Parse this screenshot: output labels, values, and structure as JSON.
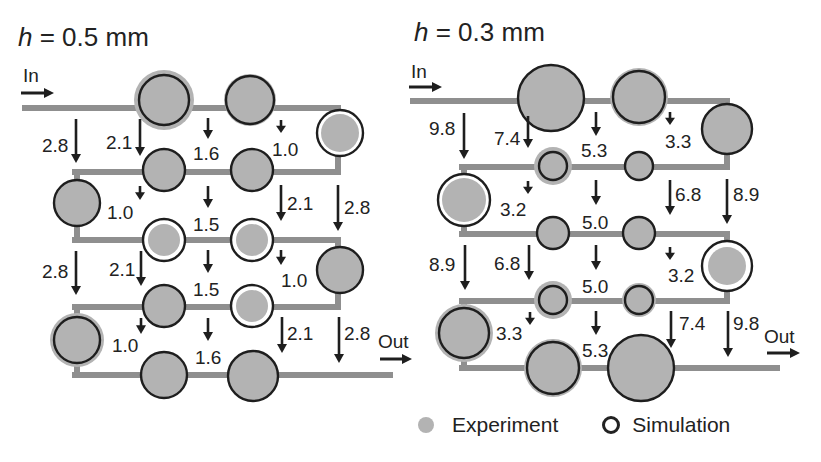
{
  "colors": {
    "channel": "#8f8f8f",
    "experiment_fill": "#b3b3b3",
    "simulation_stroke": "#1e1e1e",
    "arrow": "#1e1e1e",
    "text": "#222222"
  },
  "panels": [
    {
      "id": "h05",
      "title_var": "h",
      "title_rest": " = 0.5 mm",
      "in_label": "In",
      "out_label": "Out",
      "channels": [
        {
          "x1": 25,
          "y1": 108,
          "x2": 338,
          "y2": 108
        },
        {
          "x1": 338,
          "y1": 108,
          "x2": 338,
          "y2": 172
        },
        {
          "x1": 75,
          "y1": 172,
          "x2": 338,
          "y2": 172
        },
        {
          "x1": 77,
          "y1": 172,
          "x2": 77,
          "y2": 240
        },
        {
          "x1": 75,
          "y1": 240,
          "x2": 338,
          "y2": 240
        },
        {
          "x1": 338,
          "y1": 240,
          "x2": 338,
          "y2": 307
        },
        {
          "x1": 75,
          "y1": 307,
          "x2": 338,
          "y2": 307
        },
        {
          "x1": 77,
          "y1": 307,
          "x2": 77,
          "y2": 375
        },
        {
          "x1": 75,
          "y1": 375,
          "x2": 390,
          "y2": 375
        }
      ],
      "nodes": [
        {
          "cx": 164,
          "cy": 100,
          "exp_r": 30,
          "sim_r": 25
        },
        {
          "cx": 250,
          "cy": 100,
          "exp_r": 26,
          "sim_r": 24
        },
        {
          "cx": 340,
          "cy": 133,
          "exp_r": 19,
          "sim_r": 23
        },
        {
          "cx": 164,
          "cy": 170,
          "exp_r": 21,
          "sim_r": 21
        },
        {
          "cx": 252,
          "cy": 170,
          "exp_r": 21,
          "sim_r": 21
        },
        {
          "cx": 77,
          "cy": 203,
          "exp_r": 23,
          "sim_r": 23
        },
        {
          "cx": 164,
          "cy": 240,
          "exp_r": 16,
          "sim_r": 21
        },
        {
          "cx": 252,
          "cy": 240,
          "exp_r": 16,
          "sim_r": 21
        },
        {
          "cx": 340,
          "cy": 270,
          "exp_r": 23,
          "sim_r": 23
        },
        {
          "cx": 164,
          "cy": 306,
          "exp_r": 21,
          "sim_r": 21
        },
        {
          "cx": 252,
          "cy": 306,
          "exp_r": 16,
          "sim_r": 21
        },
        {
          "cx": 77,
          "cy": 340,
          "exp_r": 27,
          "sim_r": 23
        },
        {
          "cx": 164,
          "cy": 375,
          "exp_r": 23,
          "sim_r": 23
        },
        {
          "cx": 253,
          "cy": 376,
          "exp_r": 25,
          "sim_r": 25
        }
      ],
      "flows": [
        {
          "x": 76,
          "y1": 119,
          "y2": 163,
          "label": "2.8",
          "lx": 42,
          "ly": 152,
          "anchor": "start"
        },
        {
          "x": 140,
          "y1": 119,
          "y2": 156,
          "label": "2.1",
          "lx": 106,
          "ly": 149,
          "anchor": "start"
        },
        {
          "x": 208,
          "y1": 118,
          "y2": 139,
          "label": "1.6",
          "lx": 193,
          "ly": 160,
          "anchor": "start"
        },
        {
          "x": 281,
          "y1": 120,
          "y2": 133,
          "label": "1.0",
          "lx": 272,
          "ly": 156,
          "anchor": "start"
        },
        {
          "x": 140,
          "y1": 186,
          "y2": 200,
          "label": "1.0",
          "lx": 107,
          "ly": 219,
          "anchor": "start"
        },
        {
          "x": 208,
          "y1": 186,
          "y2": 208,
          "label": "1.5",
          "lx": 193,
          "ly": 231,
          "anchor": "start"
        },
        {
          "x": 281,
          "y1": 185,
          "y2": 221,
          "label": "2.1",
          "lx": 287,
          "ly": 210,
          "anchor": "start"
        },
        {
          "x": 338,
          "y1": 185,
          "y2": 231,
          "label": "2.8",
          "lx": 344,
          "ly": 214,
          "anchor": "start"
        },
        {
          "x": 76,
          "y1": 251,
          "y2": 295,
          "label": "2.8",
          "lx": 42,
          "ly": 278,
          "anchor": "start"
        },
        {
          "x": 141,
          "y1": 251,
          "y2": 286,
          "label": "2.1",
          "lx": 109,
          "ly": 276,
          "anchor": "start"
        },
        {
          "x": 208,
          "y1": 250,
          "y2": 273,
          "label": "1.5",
          "lx": 193,
          "ly": 296,
          "anchor": "start"
        },
        {
          "x": 281,
          "y1": 250,
          "y2": 265,
          "label": "1.0",
          "lx": 281,
          "ly": 287,
          "anchor": "start"
        },
        {
          "x": 141,
          "y1": 318,
          "y2": 334,
          "label": "1.0",
          "lx": 112,
          "ly": 352,
          "anchor": "start"
        },
        {
          "x": 208,
          "y1": 318,
          "y2": 341,
          "label": "1.6",
          "lx": 195,
          "ly": 364,
          "anchor": "start"
        },
        {
          "x": 282,
          "y1": 317,
          "y2": 353,
          "label": "2.1",
          "lx": 287,
          "ly": 340,
          "anchor": "start"
        },
        {
          "x": 339,
          "y1": 317,
          "y2": 363,
          "label": "2.8",
          "lx": 344,
          "ly": 340,
          "anchor": "start"
        }
      ],
      "in_arrow": {
        "x1": 21,
        "x2": 54,
        "y": 93,
        "lx": 23,
        "ly": 82
      },
      "out_arrow": {
        "x1": 380,
        "x2": 412,
        "y": 359,
        "lx": 378,
        "ly": 348
      }
    },
    {
      "id": "h03",
      "title_var": "h",
      "title_rest": " = 0.3 mm",
      "in_label": "In",
      "out_label": "Out",
      "channels": [
        {
          "x1": 413,
          "y1": 101,
          "x2": 727,
          "y2": 101
        },
        {
          "x1": 727,
          "y1": 101,
          "x2": 727,
          "y2": 167
        },
        {
          "x1": 462,
          "y1": 167,
          "x2": 727,
          "y2": 167
        },
        {
          "x1": 464,
          "y1": 167,
          "x2": 464,
          "y2": 234
        },
        {
          "x1": 462,
          "y1": 234,
          "x2": 727,
          "y2": 234
        },
        {
          "x1": 727,
          "y1": 234,
          "x2": 727,
          "y2": 301
        },
        {
          "x1": 462,
          "y1": 301,
          "x2": 727,
          "y2": 301
        },
        {
          "x1": 464,
          "y1": 301,
          "x2": 464,
          "y2": 368
        },
        {
          "x1": 462,
          "y1": 368,
          "x2": 777,
          "y2": 368
        }
      ],
      "nodes": [
        {
          "cx": 551,
          "cy": 98,
          "exp_r": 33,
          "sim_r": 33
        },
        {
          "cx": 639,
          "cy": 97,
          "exp_r": 29,
          "sim_r": 26
        },
        {
          "cx": 727,
          "cy": 129,
          "exp_r": 25,
          "sim_r": 25
        },
        {
          "cx": 553,
          "cy": 166,
          "exp_r": 19,
          "sim_r": 14
        },
        {
          "cx": 639,
          "cy": 166,
          "exp_r": 14,
          "sim_r": 14
        },
        {
          "cx": 464,
          "cy": 200,
          "exp_r": 22,
          "sim_r": 26
        },
        {
          "cx": 553,
          "cy": 233,
          "exp_r": 16,
          "sim_r": 16
        },
        {
          "cx": 639,
          "cy": 233,
          "exp_r": 16,
          "sim_r": 16
        },
        {
          "cx": 727,
          "cy": 266,
          "exp_r": 19,
          "sim_r": 25
        },
        {
          "cx": 553,
          "cy": 300,
          "exp_r": 19,
          "sim_r": 14
        },
        {
          "cx": 639,
          "cy": 300,
          "exp_r": 17,
          "sim_r": 14
        },
        {
          "cx": 464,
          "cy": 333,
          "exp_r": 29,
          "sim_r": 25
        },
        {
          "cx": 553,
          "cy": 368,
          "exp_r": 29,
          "sim_r": 26
        },
        {
          "cx": 641,
          "cy": 368,
          "exp_r": 33,
          "sim_r": 33
        }
      ],
      "flows": [
        {
          "x": 464,
          "y1": 113,
          "y2": 159,
          "label": "9.8",
          "lx": 429,
          "ly": 135,
          "anchor": "start"
        },
        {
          "x": 528,
          "y1": 116,
          "y2": 148,
          "label": "7.4",
          "lx": 494,
          "ly": 145,
          "anchor": "start"
        },
        {
          "x": 596,
          "y1": 112,
          "y2": 136,
          "label": "5.3",
          "lx": 581,
          "ly": 157,
          "anchor": "start"
        },
        {
          "x": 670,
          "y1": 112,
          "y2": 125,
          "label": "3.3",
          "lx": 665,
          "ly": 148,
          "anchor": "start"
        },
        {
          "x": 528,
          "y1": 181,
          "y2": 194,
          "label": "3.2",
          "lx": 500,
          "ly": 216,
          "anchor": "start"
        },
        {
          "x": 596,
          "y1": 180,
          "y2": 205,
          "label": "5.0",
          "lx": 582,
          "ly": 229,
          "anchor": "start"
        },
        {
          "x": 670,
          "y1": 180,
          "y2": 215,
          "label": "6.8",
          "lx": 675,
          "ly": 201,
          "anchor": "start"
        },
        {
          "x": 727,
          "y1": 179,
          "y2": 224,
          "label": "8.9",
          "lx": 733,
          "ly": 201,
          "anchor": "start"
        },
        {
          "x": 465,
          "y1": 245,
          "y2": 290,
          "label": "8.9",
          "lx": 429,
          "ly": 271,
          "anchor": "start"
        },
        {
          "x": 529,
          "y1": 245,
          "y2": 280,
          "label": "6.8",
          "lx": 494,
          "ly": 270,
          "anchor": "start"
        },
        {
          "x": 596,
          "y1": 245,
          "y2": 270,
          "label": "5.0",
          "lx": 582,
          "ly": 293,
          "anchor": "start"
        },
        {
          "x": 670,
          "y1": 247,
          "y2": 260,
          "label": "3.2",
          "lx": 668,
          "ly": 282,
          "anchor": "start"
        },
        {
          "x": 530,
          "y1": 312,
          "y2": 325,
          "label": "3.3",
          "lx": 496,
          "ly": 340,
          "anchor": "start"
        },
        {
          "x": 596,
          "y1": 311,
          "y2": 335,
          "label": "5.3",
          "lx": 582,
          "ly": 357,
          "anchor": "start"
        },
        {
          "x": 671,
          "y1": 311,
          "y2": 348,
          "label": "7.4",
          "lx": 679,
          "ly": 330,
          "anchor": "start"
        },
        {
          "x": 728,
          "y1": 311,
          "y2": 357,
          "label": "9.8",
          "lx": 733,
          "ly": 330,
          "anchor": "start"
        }
      ],
      "in_arrow": {
        "x1": 409,
        "x2": 442,
        "y": 87,
        "lx": 411,
        "ly": 78
      },
      "out_arrow": {
        "x1": 767,
        "x2": 800,
        "y": 353,
        "lx": 764,
        "ly": 343
      }
    }
  ],
  "legend": {
    "experiment_label": "Experiment",
    "simulation_label": "Simulation"
  }
}
